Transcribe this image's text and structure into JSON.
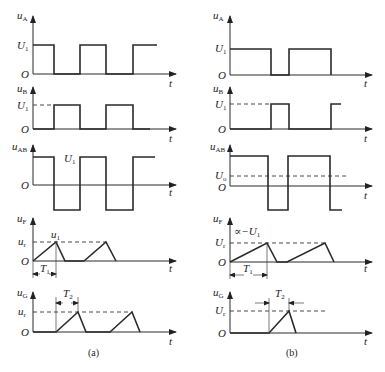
{
  "figure": {
    "panels": [
      {
        "id": "a",
        "caption": "(a)",
        "plots": [
          {
            "name": "uA",
            "ylabel": "u",
            "ysub": "A",
            "levels": [
              "U",
              "O"
            ],
            "level_sub": "1",
            "xlabel": "t"
          },
          {
            "name": "uB",
            "ylabel": "u",
            "ysub": "B",
            "levels": [
              "U",
              "O"
            ],
            "level_sub": "1",
            "xlabel": "t"
          },
          {
            "name": "uAB",
            "ylabel": "u",
            "ysub": "AB",
            "annotation": "U",
            "annotation_sub": "1",
            "origin": "O",
            "xlabel": "t"
          },
          {
            "name": "uF",
            "ylabel": "u",
            "ysub": "F",
            "level": "u",
            "level_sub": "r",
            "peak": "u",
            "peak_sub": "1",
            "origin": "O",
            "period": "T",
            "period_sub": "1",
            "xlabel": "t"
          },
          {
            "name": "uG",
            "ylabel": "u",
            "ysub": "G",
            "level": "u",
            "level_sub": "r",
            "origin": "O",
            "period": "T",
            "period_sub": "2",
            "xlabel": "t"
          }
        ]
      },
      {
        "id": "b",
        "caption": "(b)",
        "plots": [
          {
            "name": "uA",
            "ylabel": "u",
            "ysub": "A",
            "levels": [
              "U",
              "O"
            ],
            "level_sub": "1",
            "xlabel": "t"
          },
          {
            "name": "uB",
            "ylabel": "u",
            "ysub": "B",
            "levels": [
              "U",
              "O"
            ],
            "level_sub": "1",
            "xlabel": "t"
          },
          {
            "name": "uAB",
            "ylabel": "u",
            "ysub": "AB",
            "level": "U",
            "level_sub": "o",
            "origin": "O",
            "xlabel": "t"
          },
          {
            "name": "uF",
            "ylabel": "u",
            "ysub": "F",
            "level": "U",
            "level_sub": "r",
            "annotation": "∝−U",
            "annotation_sub": "1",
            "origin": "O",
            "period": "T",
            "period_sub": "1",
            "xlabel": "t"
          },
          {
            "name": "uG",
            "ylabel": "u",
            "ysub": "G",
            "level": "U",
            "level_sub": "r",
            "origin": "O",
            "period": "T",
            "period_sub": "2",
            "xlabel": "t"
          }
        ]
      }
    ]
  }
}
